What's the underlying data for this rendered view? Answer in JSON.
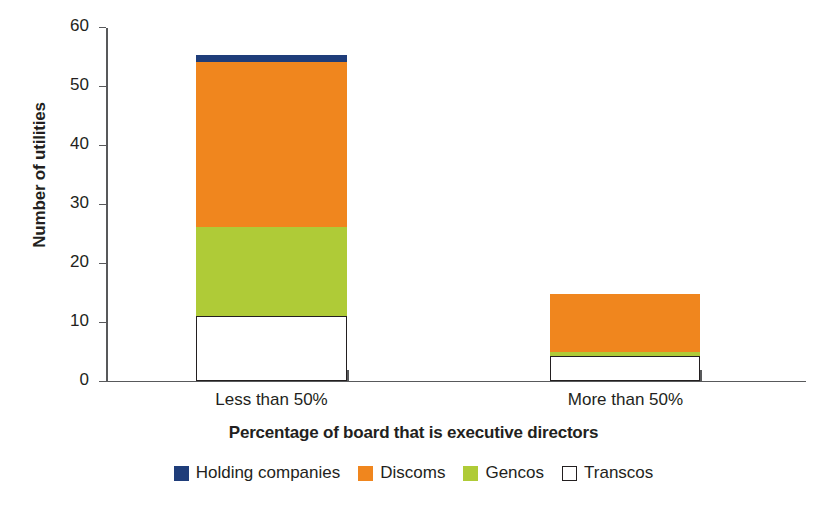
{
  "chart_data": {
    "type": "bar",
    "stacked": true,
    "title": "",
    "xlabel": "Percentage of board that is executive directors",
    "ylabel": "Number of utilities",
    "categories": [
      "Less than 50%",
      "More than 50%"
    ],
    "ylim": [
      0,
      60
    ],
    "yticks": [
      0,
      10,
      20,
      30,
      40,
      50,
      60
    ],
    "ytick_labels": [
      "0",
      "10",
      "20",
      "30",
      "40",
      "50",
      "60"
    ],
    "grid": false,
    "legend_position": "bottom",
    "series": [
      {
        "name": "Transcos",
        "color": "#ffffff",
        "border": "#231f20",
        "values": [
          11,
          4.2
        ]
      },
      {
        "name": "Gencos",
        "color": "#afcb37",
        "values": [
          15,
          0.7
        ]
      },
      {
        "name": "Discoms",
        "color": "#f0861e",
        "values": [
          28,
          9.8
        ]
      },
      {
        "name": "Holding companies",
        "color": "#1f3d7a",
        "values": [
          1.2,
          0
        ]
      }
    ],
    "totals": [
      55.2,
      14.7
    ],
    "legend": [
      {
        "label": "Holding companies",
        "color": "#1f3d7a",
        "border": "#1f3d7a"
      },
      {
        "label": "Discoms",
        "color": "#f0861e",
        "border": "#f0861e"
      },
      {
        "label": "Gencos",
        "color": "#afcb37",
        "border": "#afcb37"
      },
      {
        "label": "Transcos",
        "color": "#ffffff",
        "border": "#231f20"
      }
    ]
  }
}
